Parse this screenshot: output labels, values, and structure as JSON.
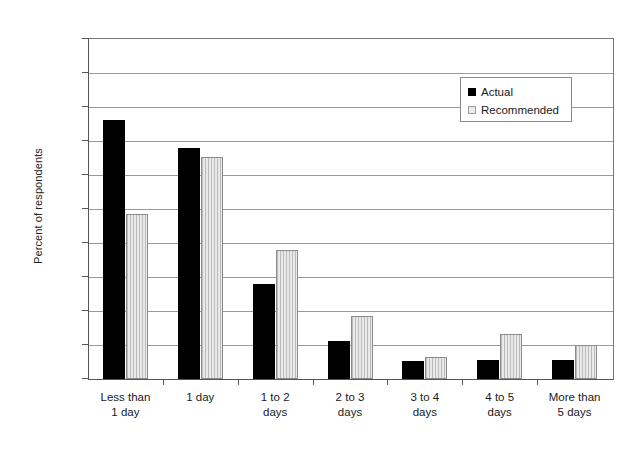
{
  "chart_data": {
    "type": "bar",
    "title": "",
    "xlabel": "",
    "ylabel": "Percent of respondents",
    "ylim": [
      0,
      50
    ],
    "ytick_step": 5,
    "ytick_labels": [
      "0%",
      "5%",
      "10%",
      "15%",
      "20%",
      "25%",
      "30%",
      "35%",
      "40%",
      "45%",
      "50%"
    ],
    "ytick_values": [
      0,
      5,
      10,
      15,
      20,
      25,
      30,
      35,
      40,
      45,
      50
    ],
    "grid": true,
    "legend_position": "upper right",
    "categories": [
      "Less than\n1 day",
      "1 day",
      "1 to 2\ndays",
      "2 to 3\ndays",
      "3 to 4\ndays",
      "4 to 5\ndays",
      "More than\n5 days"
    ],
    "category_labels": [
      {
        "line1": "Less than",
        "line2": "1 day"
      },
      {
        "line1": "1 day",
        "line2": ""
      },
      {
        "line1": "1 to 2",
        "line2": "days"
      },
      {
        "line1": "2 to 3",
        "line2": "days"
      },
      {
        "line1": "3 to 4",
        "line2": "days"
      },
      {
        "line1": "4 to 5",
        "line2": "days"
      },
      {
        "line1": "More than",
        "line2": "5 days"
      }
    ],
    "series": [
      {
        "name": "Actual",
        "color": "#000000",
        "values": [
          38.1,
          34.0,
          14.0,
          5.6,
          2.7,
          2.8,
          2.8
        ]
      },
      {
        "name": "Recommended",
        "color": "#e9e9e9",
        "values": [
          24.2,
          32.6,
          18.9,
          9.2,
          3.3,
          6.6,
          5.0
        ]
      }
    ]
  },
  "legend": {
    "entries": [
      {
        "label": "Actual"
      },
      {
        "label": "Recommended"
      }
    ]
  },
  "axes": {
    "y_title": "Percent of respondents"
  }
}
